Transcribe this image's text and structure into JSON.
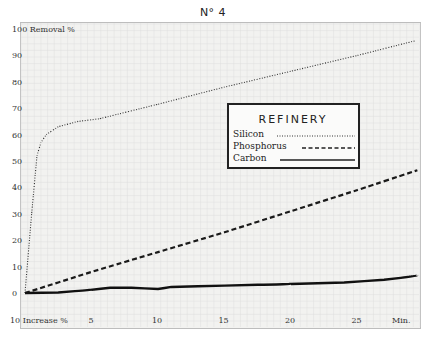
{
  "header": {
    "figure_number": "N° 4"
  },
  "chart_data": {
    "type": "line",
    "title": "N° 4",
    "xlabel": "Min.",
    "ylabel": "Removal %",
    "x_axis_secondary_label": "Increase %",
    "ylim": [
      0,
      100
    ],
    "xlim": [
      0,
      30
    ],
    "x_ticks": [
      5,
      10,
      15,
      20,
      25
    ],
    "y_ticks": [
      0,
      10,
      20,
      30,
      40,
      50,
      60,
      70,
      80,
      90,
      100
    ],
    "y_tick_labels": [
      "0",
      "10",
      "20",
      "30",
      "40",
      "50",
      "60",
      "70",
      "80",
      "90",
      "100 Removal %"
    ],
    "x_tick_labels": [
      "10 Increase %",
      "5",
      "10",
      "15",
      "20",
      "25",
      "Min."
    ],
    "grid": true,
    "legend": {
      "title": "REFINERY",
      "position": "upper right (inside plot)",
      "entries": [
        {
          "name": "Silicon",
          "style": "dotted"
        },
        {
          "name": "Phosphorus",
          "style": "dashed"
        },
        {
          "name": "Carbon",
          "style": "solid"
        }
      ]
    },
    "series": [
      {
        "name": "Silicon",
        "style": "dotted",
        "x": [
          0,
          0.5,
          0.9,
          1.2,
          1.6,
          2.5,
          4,
          5.6,
          10,
          15,
          20,
          25,
          29.3
        ],
        "y": [
          0,
          30,
          52,
          57,
          60,
          63,
          65,
          66,
          71.5,
          78,
          84,
          90,
          95.5
        ]
      },
      {
        "name": "Phosphorus",
        "style": "dashed",
        "x": [
          0,
          5,
          10,
          15,
          20,
          25,
          29.5
        ],
        "y": [
          0,
          8,
          15.5,
          23,
          31,
          39,
          46.5
        ]
      },
      {
        "name": "Carbon",
        "style": "solid",
        "x": [
          0,
          2.5,
          5,
          6.4,
          8,
          10,
          11,
          15,
          20,
          24,
          27,
          29.5
        ],
        "y": [
          0,
          0.2,
          1.2,
          2,
          2,
          1.5,
          2.3,
          2.8,
          3.4,
          4,
          5,
          6.5
        ]
      }
    ]
  },
  "colors": {
    "background": "#f2f2f0",
    "grid": "#dcdcdc",
    "ink": "#222222",
    "frame": "#bdbdbd"
  }
}
